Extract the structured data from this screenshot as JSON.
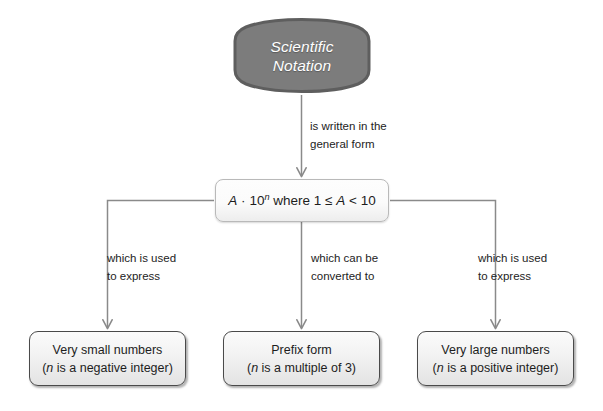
{
  "diagram": {
    "title": "Scientific Notation",
    "type": "flowchart",
    "colors": {
      "banner_fill": "#7c7c7c",
      "banner_stroke": "#5e5e5e",
      "banner_text": "#ffffff",
      "node_fill": "#f2f2f2",
      "node_stroke": "#4a4a4a",
      "formula_stroke": "#b9b9b9",
      "connector": "#8a8a8a",
      "text": "#1d1d1d",
      "background": "#ffffff"
    },
    "root": {
      "label_line1": "Scientific",
      "label_line2": "Notation"
    },
    "formula": {
      "coefficient": "A",
      "operator": "·",
      "base": "10",
      "exponent": "n",
      "condition_prefix": "where 1 ≤ ",
      "condition_var": "A",
      "condition_suffix": " < 10",
      "full_text": "A · 10ⁿ where 1 ≤ A < 10"
    },
    "edges": [
      {
        "id": "root-to-formula",
        "label_line1": "is written in the",
        "label_line2": "general form"
      },
      {
        "id": "formula-to-small",
        "label_line1": "which is used",
        "label_line2": "to express"
      },
      {
        "id": "formula-to-prefix",
        "label_line1": "which can be",
        "label_line2": "converted to"
      },
      {
        "id": "formula-to-large",
        "label_line1": "which is used",
        "label_line2": "to express"
      }
    ],
    "outcomes": [
      {
        "id": "very-small-numbers",
        "line1": "Very small numbers",
        "line2_open": "(",
        "line2_var": "n",
        "line2_rest": " is a negative integer)"
      },
      {
        "id": "prefix-form",
        "line1": "Prefix form",
        "line2_open": "(",
        "line2_var": "n",
        "line2_rest": " is a multiple of 3)"
      },
      {
        "id": "very-large-numbers",
        "line1": "Very large numbers",
        "line2_open": "(",
        "line2_var": "n",
        "line2_rest": " is a positive integer)"
      }
    ]
  }
}
